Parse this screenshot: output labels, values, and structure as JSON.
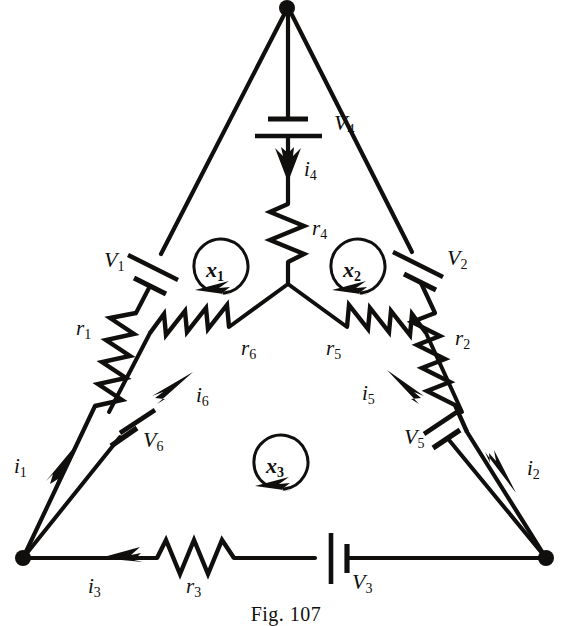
{
  "figure": {
    "caption": "Fig. 107",
    "ink_color": "#100f0d",
    "background_color": "#ffffff"
  },
  "nodes": {
    "top": {
      "name": "top-vertex",
      "x": 287,
      "y": 7
    },
    "bottom_left": {
      "name": "bottom-left-vertex",
      "x": 23,
      "y": 558
    },
    "bottom_right": {
      "name": "bottom-right-vertex",
      "x": 546,
      "y": 558
    },
    "center": {
      "name": "center-junction",
      "x": 288,
      "y": 284
    },
    "inner_left": {
      "name": "inner-left-corner",
      "x": 23,
      "y": 558
    },
    "inner_right": {
      "name": "inner-right-corner",
      "x": 546,
      "y": 558
    }
  },
  "labels": {
    "V1": {
      "text": "V",
      "sub": "1",
      "x": 104,
      "y": 267
    },
    "V2": {
      "text": "V",
      "sub": "2",
      "x": 447,
      "y": 265
    },
    "V3": {
      "text": "V",
      "sub": "3",
      "x": 362,
      "y": 589
    },
    "V4": {
      "text": "V",
      "sub": "4",
      "x": 312,
      "y": 129
    },
    "V5": {
      "text": "V",
      "sub": "5",
      "x": 408,
      "y": 443
    },
    "V6": {
      "text": "V",
      "sub": "6",
      "x": 148,
      "y": 447
    },
    "r1": {
      "text": "r",
      "sub": "1",
      "x": 85,
      "y": 329
    },
    "r2": {
      "text": "r",
      "sub": "2",
      "x": 457,
      "y": 339
    },
    "r3": {
      "text": "r",
      "sub": "3",
      "x": 190,
      "y": 589
    },
    "r4": {
      "text": "r",
      "sub": "4",
      "x": 314,
      "y": 234
    },
    "r5": {
      "text": "r",
      "sub": "5",
      "x": 330,
      "y": 351
    },
    "r6": {
      "text": "r",
      "sub": "6",
      "x": 245,
      "y": 351
    },
    "i1": {
      "text": "i",
      "sub": "1",
      "x": 20,
      "y": 467
    },
    "i2": {
      "text": "i",
      "sub": "2",
      "x": 525,
      "y": 470
    },
    "i3": {
      "text": "i",
      "sub": "3",
      "x": 92,
      "y": 589
    },
    "i4": {
      "text": "i",
      "sub": "4",
      "x": 302,
      "y": 170
    },
    "i5": {
      "text": "i",
      "sub": "5",
      "x": 366,
      "y": 396
    },
    "i6": {
      "text": "i",
      "sub": "6",
      "x": 199,
      "y": 398
    },
    "x1": {
      "text": "x",
      "sub": "1",
      "x": 212,
      "y": 268
    },
    "x2": {
      "text": "x",
      "sub": "2",
      "x": 349,
      "y": 268
    },
    "x3": {
      "text": "x",
      "sub": "3",
      "x": 272,
      "y": 464
    }
  },
  "components": {
    "resistors": [
      {
        "id": "r1",
        "label": "r1",
        "branch": "left-outer-edge"
      },
      {
        "id": "r2",
        "label": "r2",
        "branch": "right-outer-edge"
      },
      {
        "id": "r3",
        "label": "r3",
        "branch": "bottom-outer-edge"
      },
      {
        "id": "r4",
        "label": "r4",
        "branch": "top-spoke"
      },
      {
        "id": "r5",
        "label": "r5",
        "branch": "right-spoke"
      },
      {
        "id": "r6",
        "label": "r6",
        "branch": "left-spoke"
      }
    ],
    "batteries": [
      {
        "id": "V1",
        "label": "V1",
        "branch": "left-outer-edge"
      },
      {
        "id": "V2",
        "label": "V2",
        "branch": "right-outer-edge"
      },
      {
        "id": "V3",
        "label": "V3",
        "branch": "bottom-outer-edge"
      },
      {
        "id": "V4",
        "label": "V4",
        "branch": "top-spoke"
      },
      {
        "id": "V5",
        "label": "V5",
        "branch": "right-inner-edge"
      },
      {
        "id": "V6",
        "label": "V6",
        "branch": "left-inner-edge"
      }
    ],
    "currents": [
      {
        "id": "i1",
        "label": "i1",
        "direction": "up-right along left outer edge"
      },
      {
        "id": "i2",
        "label": "i2",
        "direction": "down-right along right outer edge"
      },
      {
        "id": "i3",
        "label": "i3",
        "direction": "left along bottom edge"
      },
      {
        "id": "i4",
        "label": "i4",
        "direction": "down along top spoke"
      },
      {
        "id": "i5",
        "label": "i5",
        "direction": "up-left toward center"
      },
      {
        "id": "i6",
        "label": "i6",
        "direction": "up-right toward center"
      }
    ],
    "mesh_loops": [
      {
        "id": "x1",
        "label": "x1",
        "sense": "counterclockwise"
      },
      {
        "id": "x2",
        "label": "x2",
        "sense": "counterclockwise"
      },
      {
        "id": "x3",
        "label": "x3",
        "sense": "counterclockwise"
      }
    ]
  }
}
